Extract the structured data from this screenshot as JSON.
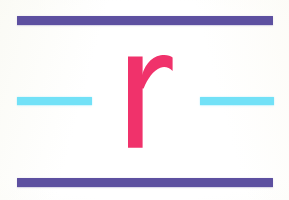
{
  "artwork": {
    "title": "Lowercase r with rules",
    "background_color": "#fdfdfb",
    "width": 289,
    "height": 200
  },
  "glyph": {
    "character": "r",
    "case": "lowercase",
    "color": "#f0326b",
    "style": "serifless slab stem with curved shoulder arm",
    "label": "pink-letter-r"
  },
  "rules": {
    "purple_color": "#5d50a0",
    "cyan_color": "#72e1f7",
    "top": {
      "label": "top purple rule",
      "color": "#5d50a0",
      "x": 17,
      "y": 16,
      "width": 256,
      "height": 9
    },
    "bottom": {
      "label": "bottom purple rule",
      "color": "#5d50a0",
      "x": 17,
      "y": 178,
      "width": 256,
      "height": 9
    },
    "dash_left": {
      "label": "left cyan dash",
      "color": "#72e1f7",
      "x": 17,
      "y": 97,
      "width": 75,
      "height": 8
    },
    "dash_right": {
      "label": "right cyan dash",
      "color": "#72e1f7",
      "x": 200,
      "y": 97,
      "width": 74,
      "height": 8
    }
  },
  "caption": "r"
}
